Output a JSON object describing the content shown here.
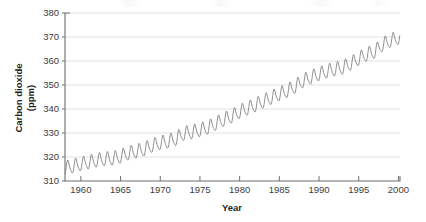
{
  "figure": {
    "background_color": "#ffffff",
    "plot_area": {
      "left": 65,
      "top": 13,
      "right": 400,
      "bottom": 181
    }
  },
  "chart_data": {
    "type": "line",
    "title": "",
    "xlabel": "Year",
    "ylabel": "Carbon dioxide (ppm)",
    "ylabel_lines": [
      "Carbon dioxide",
      "(ppm)"
    ],
    "xlim": [
      1958.0,
      2000.2
    ],
    "ylim": [
      310,
      380
    ],
    "xticks": [
      1960,
      1965,
      1970,
      1975,
      1980,
      1985,
      1990,
      1995,
      2000
    ],
    "xtick_labels": [
      "1960",
      "1965",
      "1970",
      "1975",
      "1980",
      "1985",
      "1990",
      "1995",
      "2000"
    ],
    "yticks": [
      310,
      320,
      330,
      340,
      350,
      360,
      370,
      380
    ],
    "ytick_labels": [
      "310",
      "320",
      "330",
      "340",
      "350",
      "360",
      "370",
      "380"
    ],
    "grid": {
      "horizontal": true,
      "vertical": false,
      "color": "#d9d9dc"
    },
    "legend": {
      "visible": false
    },
    "line_color": "#7c7c80",
    "series": [
      {
        "name": "Atmospheric CO2 (Mauna Loa)",
        "description": "Monthly mean atmospheric carbon dioxide concentration showing a rising trend with an annual seasonal oscillation of about 6 ppm peak-to-peak.",
        "annual_mean": {
          "x": [
            1958,
            1959,
            1960,
            1961,
            1962,
            1963,
            1964,
            1965,
            1966,
            1967,
            1968,
            1969,
            1970,
            1971,
            1972,
            1973,
            1974,
            1975,
            1976,
            1977,
            1978,
            1979,
            1980,
            1981,
            1982,
            1983,
            1984,
            1985,
            1986,
            1987,
            1988,
            1989,
            1990,
            1991,
            1992,
            1993,
            1994,
            1995,
            1996,
            1997,
            1998,
            1999,
            2000
          ],
          "y": [
            315.3,
            315.98,
            316.91,
            317.64,
            318.45,
            318.99,
            319.2,
            320.04,
            321.38,
            322.16,
            323.04,
            324.62,
            325.68,
            326.32,
            327.45,
            329.68,
            330.17,
            331.08,
            332.05,
            333.78,
            335.41,
            336.78,
            338.68,
            340.1,
            341.44,
            343.03,
            344.58,
            346.04,
            347.39,
            349.16,
            351.56,
            353.07,
            354.35,
            355.57,
            356.38,
            357.07,
            358.82,
            360.8,
            362.59,
            363.71,
            366.65,
            368.33,
            369.52
          ]
        },
        "seasonal_amplitude_ppm": 3.1,
        "seasonal_peak_month": "May",
        "seasonal_trough_month": "September",
        "y_min_observed": 313.2,
        "y_max_observed": 371.9
      }
    ]
  }
}
